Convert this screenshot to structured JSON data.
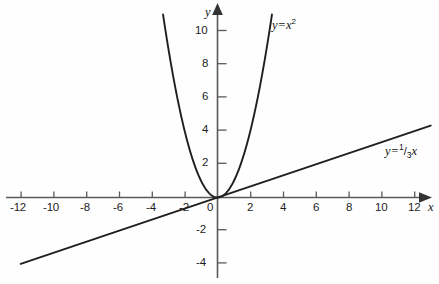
{
  "chart_data": {
    "type": "line",
    "title": "",
    "xlabel": "x",
    "ylabel": "y",
    "xlim": [
      -13,
      13
    ],
    "ylim": [
      -4.8,
      11.6
    ],
    "grid": false,
    "legend_position": "inline-annotations",
    "x_ticks": [
      -12,
      -10,
      -8,
      -6,
      -4,
      -2,
      0,
      2,
      4,
      6,
      8,
      10,
      12
    ],
    "x_tick_labels": [
      "-12",
      "-10",
      "-8",
      "-6",
      "-4",
      "-2",
      "0",
      "2",
      "4",
      "6",
      "8",
      "10",
      "12"
    ],
    "y_ticks": [
      -4,
      -2,
      2,
      4,
      6,
      8,
      10
    ],
    "y_tick_labels": [
      "-4",
      "-2",
      "2",
      "4",
      "6",
      "8",
      "10"
    ],
    "series": [
      {
        "name": "y=x^2",
        "label_text": "y=x",
        "label_exponent": "2",
        "equation": "y = x^2",
        "type": "parabola",
        "coefficient": 1,
        "x_domain": [
          -3.32,
          3.32
        ],
        "points_x": [
          -3.32,
          -3.0,
          -2.5,
          -2.0,
          -1.5,
          -1.0,
          -0.5,
          0,
          0.5,
          1.0,
          1.5,
          2.0,
          2.5,
          3.0,
          3.32
        ],
        "points_y": [
          11.02,
          9.0,
          6.25,
          4.0,
          2.25,
          1.0,
          0.25,
          0,
          0.25,
          1.0,
          2.25,
          4.0,
          6.25,
          9.0,
          11.02
        ]
      },
      {
        "name": "y=1/3 x",
        "label_prefix": "y=",
        "label_numerator": "1",
        "label_slash": "/",
        "label_denominator": "3",
        "label_suffix": "x",
        "equation": "y = (1/3)x",
        "type": "linear",
        "slope": 0.3333,
        "intercept": 0,
        "x_domain": [
          -12,
          13
        ],
        "points_x": [
          -12,
          -6,
          0,
          6,
          12,
          13
        ],
        "points_y": [
          -4.0,
          -2.0,
          0,
          2.0,
          4.0,
          4.33
        ]
      }
    ],
    "annotations": [
      {
        "text": "y=x²",
        "series": "y=x^2"
      },
      {
        "text": "y=¹⁄₃x",
        "series": "y=1/3 x"
      }
    ],
    "axis_labels": {
      "x": "x",
      "y": "y"
    },
    "origin_label": "0"
  },
  "colors": {
    "background": "#fefefe",
    "axis": "#4a4a4a",
    "curve": "#1a1a1a",
    "text": "#151515"
  }
}
